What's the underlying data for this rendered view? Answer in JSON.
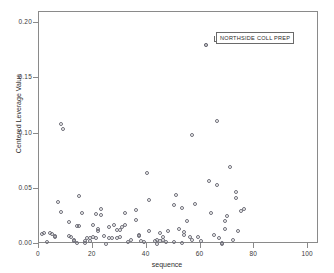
{
  "chart_data": {
    "type": "scatter",
    "title": "",
    "xlabel": "sequence",
    "ylabel": "Centered Leverage Value",
    "xlim": [
      0,
      104
    ],
    "ylim": [
      0.0,
      0.21
    ],
    "xticks": [
      0,
      20,
      40,
      60,
      80,
      100
    ],
    "xtick_labels": [
      "0",
      "20",
      "40",
      "60",
      "80",
      "100"
    ],
    "yticks": [
      0.0,
      0.05,
      0.1,
      0.15,
      0.2
    ],
    "ytick_labels": [
      "0.00",
      "0.05",
      "0.10",
      "0.15",
      "0.20"
    ],
    "grid": false,
    "legend": null,
    "marker": "open-circle",
    "marker_color": "#6e6e78",
    "frame_color": "#8a8a8a",
    "annotations": [
      {
        "text": "NORTHSIDE COLL PREP",
        "x": 62,
        "y": 0.18
      }
    ],
    "points": [
      {
        "x": 1,
        "y": 0.009
      },
      {
        "x": 2,
        "y": 0.01
      },
      {
        "x": 3,
        "y": 0.002
      },
      {
        "x": 4,
        "y": 0.01
      },
      {
        "x": 5,
        "y": 0.009
      },
      {
        "x": 6,
        "y": 0.006
      },
      {
        "x": 6,
        "y": 0.007
      },
      {
        "x": 7,
        "y": 0.038
      },
      {
        "x": 8,
        "y": 0.109
      },
      {
        "x": 8,
        "y": 0.029
      },
      {
        "x": 9,
        "y": 0.104
      },
      {
        "x": 11,
        "y": 0.02
      },
      {
        "x": 11,
        "y": 0.007
      },
      {
        "x": 12,
        "y": 0.006
      },
      {
        "x": 13,
        "y": 0.003
      },
      {
        "x": 13,
        "y": 0.004
      },
      {
        "x": 14,
        "y": 0.016
      },
      {
        "x": 14,
        "y": 0.001
      },
      {
        "x": 15,
        "y": 0.016
      },
      {
        "x": 15,
        "y": 0.043
      },
      {
        "x": 16,
        "y": 0.028
      },
      {
        "x": 17,
        "y": 0.003
      },
      {
        "x": 17,
        "y": 0.001
      },
      {
        "x": 18,
        "y": 0.005
      },
      {
        "x": 19,
        "y": 0.005
      },
      {
        "x": 19,
        "y": 0.003
      },
      {
        "x": 20,
        "y": 0.017
      },
      {
        "x": 20,
        "y": 0.006
      },
      {
        "x": 21,
        "y": 0.027
      },
      {
        "x": 21,
        "y": 0.005
      },
      {
        "x": 22,
        "y": 0.014
      },
      {
        "x": 22,
        "y": 0.012
      },
      {
        "x": 23,
        "y": 0.032
      },
      {
        "x": 23,
        "y": 0.026
      },
      {
        "x": 24,
        "y": 0.007
      },
      {
        "x": 25,
        "y": 0.0
      },
      {
        "x": 26,
        "y": 0.015
      },
      {
        "x": 26,
        "y": 0.005
      },
      {
        "x": 27,
        "y": 0.005
      },
      {
        "x": 28,
        "y": 0.017
      },
      {
        "x": 29,
        "y": 0.013
      },
      {
        "x": 29,
        "y": 0.005
      },
      {
        "x": 30,
        "y": 0.013
      },
      {
        "x": 30,
        "y": 0.006
      },
      {
        "x": 31,
        "y": 0.015
      },
      {
        "x": 32,
        "y": 0.028
      },
      {
        "x": 32,
        "y": 0.017
      },
      {
        "x": 33,
        "y": 0.002
      },
      {
        "x": 34,
        "y": 0.004
      },
      {
        "x": 36,
        "y": 0.031
      },
      {
        "x": 36,
        "y": 0.022
      },
      {
        "x": 37,
        "y": 0.008
      },
      {
        "x": 37,
        "y": 0.007
      },
      {
        "x": 38,
        "y": 0.003
      },
      {
        "x": 39,
        "y": 0.002
      },
      {
        "x": 40,
        "y": 0.064
      },
      {
        "x": 41,
        "y": 0.04
      },
      {
        "x": 41,
        "y": 0.012
      },
      {
        "x": 43,
        "y": 0.003
      },
      {
        "x": 44,
        "y": 0.004
      },
      {
        "x": 44,
        "y": 0.0
      },
      {
        "x": 45,
        "y": 0.01
      },
      {
        "x": 45,
        "y": 0.003
      },
      {
        "x": 46,
        "y": 0.006
      },
      {
        "x": 46,
        "y": 0.004
      },
      {
        "x": 47,
        "y": 0.002
      },
      {
        "x": 48,
        "y": 0.012
      },
      {
        "x": 50,
        "y": 0.035
      },
      {
        "x": 50,
        "y": 0.002
      },
      {
        "x": 51,
        "y": 0.044
      },
      {
        "x": 52,
        "y": 0.014
      },
      {
        "x": 53,
        "y": 0.033
      },
      {
        "x": 53,
        "y": 0.001
      },
      {
        "x": 54,
        "y": 0.011
      },
      {
        "x": 54,
        "y": 0.008
      },
      {
        "x": 55,
        "y": 0.021
      },
      {
        "x": 56,
        "y": 0.006
      },
      {
        "x": 57,
        "y": 0.004
      },
      {
        "x": 57,
        "y": 0.099
      },
      {
        "x": 58,
        "y": 0.036
      },
      {
        "x": 59,
        "y": 0.006
      },
      {
        "x": 60,
        "y": 0.003
      },
      {
        "x": 62,
        "y": 0.18
      },
      {
        "x": 63,
        "y": 0.057
      },
      {
        "x": 64,
        "y": 0.028
      },
      {
        "x": 65,
        "y": 0.008
      },
      {
        "x": 66,
        "y": 0.111
      },
      {
        "x": 66,
        "y": 0.053
      },
      {
        "x": 67,
        "y": 0.005
      },
      {
        "x": 68,
        "y": 0.001
      },
      {
        "x": 68,
        "y": 0.0
      },
      {
        "x": 69,
        "y": 0.021
      },
      {
        "x": 69,
        "y": 0.014
      },
      {
        "x": 70,
        "y": 0.025
      },
      {
        "x": 71,
        "y": 0.07
      },
      {
        "x": 72,
        "y": 0.004
      },
      {
        "x": 73,
        "y": 0.042
      },
      {
        "x": 73,
        "y": 0.047
      },
      {
        "x": 74,
        "y": 0.012
      },
      {
        "x": 75,
        "y": 0.03
      },
      {
        "x": 76,
        "y": 0.032
      }
    ]
  }
}
